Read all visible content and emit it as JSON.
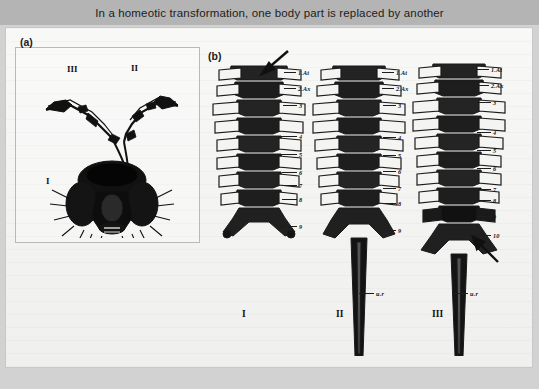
{
  "figure": {
    "caption": "In a homeotic transformation, one body part is replaced by another",
    "panels": [
      {
        "id": "a",
        "label": "(a)",
        "name": "fly-head-antennapedia",
        "annotations": [
          {
            "text": "III",
            "name": "fly-segment-three"
          },
          {
            "text": "II",
            "name": "fly-segment-two"
          },
          {
            "text": "I",
            "name": "fly-segment-one"
          }
        ]
      },
      {
        "id": "b",
        "label": "(b)",
        "name": "vertebral-columns",
        "columns": [
          {
            "roman": "I",
            "name": "vertebral-column-one",
            "segments": [
              "1.At",
              "2.Ax",
              "3",
              "4",
              "5",
              "6",
              "7",
              "8",
              "9"
            ],
            "sacrum_label": "",
            "arrow": "down-left-arrow-top"
          },
          {
            "roman": "II",
            "name": "vertebral-column-two",
            "segments": [
              "1.At",
              "2.Ax",
              "3",
              "4",
              "5",
              "6",
              "7",
              "8",
              "9"
            ],
            "sacrum_label": "u.r",
            "arrow": ""
          },
          {
            "roman": "III",
            "name": "vertebral-column-three",
            "segments": [
              "1.At",
              "2.Ax",
              "3",
              "4",
              "5",
              "6",
              "7",
              "8",
              "9",
              "10"
            ],
            "sacrum_label": "u.r",
            "arrow": "up-left-arrow-bottom"
          }
        ]
      }
    ]
  },
  "colors": {
    "title_bar": "#b4b4b4",
    "title_text": "#1c1c1c",
    "paper": "#f0f0ee",
    "ink": "#141414",
    "frame_border": "#c8c8c8"
  }
}
